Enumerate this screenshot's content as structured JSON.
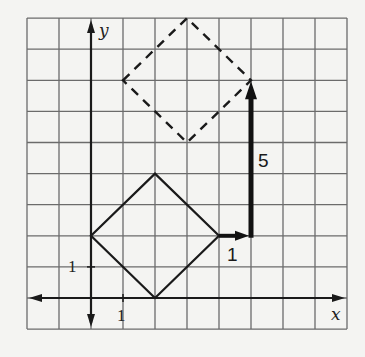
{
  "figure": {
    "grid": {
      "x_min": -2,
      "x_max": 8,
      "y_min": -1,
      "y_max": 9,
      "origin_px": [
        91,
        298
      ],
      "cell_w": 32,
      "cell_h": 31.1,
      "grid_color": "#6b6b6b",
      "background": "#f4f4f2"
    },
    "axes": {
      "x_label": "x",
      "y_label": "y",
      "x_tick_label": "1",
      "y_tick_label": "1",
      "color": "#1a1a1a"
    },
    "original_figure": {
      "style": "solid",
      "vertices": [
        [
          0,
          2
        ],
        [
          2,
          4
        ],
        [
          4,
          2
        ],
        [
          2,
          0
        ]
      ]
    },
    "translated_figure": {
      "style": "dashed",
      "vertices": [
        [
          1,
          7
        ],
        [
          3,
          9
        ],
        [
          5,
          7
        ],
        [
          3,
          5
        ]
      ]
    },
    "translation_arrows": [
      {
        "from": [
          4,
          2
        ],
        "to": [
          5,
          2
        ],
        "label": "1"
      },
      {
        "from": [
          5,
          2
        ],
        "to": [
          5,
          7
        ],
        "label": "5"
      }
    ]
  }
}
